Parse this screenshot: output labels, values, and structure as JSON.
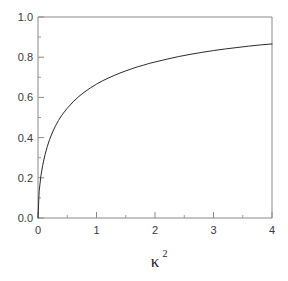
{
  "figure": {
    "background_color": "#ffffff",
    "frame_color": "#8a8a8a",
    "curve_color": "#2b2b2b",
    "tick_label_color": "#3a3a3a",
    "axis_label_color": "#222222"
  },
  "chart_data": {
    "type": "line",
    "title": "",
    "subtitle": "",
    "xlabel": "κ",
    "xlabel_superscript": "2",
    "ylabel": "",
    "xlim": [
      0,
      4
    ],
    "ylim": [
      0.0,
      1.0
    ],
    "grid": false,
    "legend": null,
    "legend_position": "none",
    "xticks": [
      0,
      1,
      2,
      3,
      4
    ],
    "xtick_labels": [
      "0",
      "1",
      "2",
      "3",
      "4"
    ],
    "xminor_step": 0.5,
    "yticks": [
      0.0,
      0.2,
      0.4,
      0.6,
      0.8,
      1.0
    ],
    "ytick_labels": [
      "0.0",
      "0.2",
      "0.4",
      "0.6",
      "0.8",
      "1.0"
    ],
    "yminor_step": 0.1,
    "series": [
      {
        "name": "saturation-curve",
        "color": "#2b2b2b",
        "linewidth": 1,
        "x": [
          0.0,
          0.02,
          0.05,
          0.08,
          0.12,
          0.16,
          0.2,
          0.25,
          0.3,
          0.35,
          0.4,
          0.45,
          0.5,
          0.6,
          0.7,
          0.8,
          0.9,
          1.0,
          1.1,
          1.2,
          1.3,
          1.4,
          1.5,
          1.6,
          1.7,
          1.8,
          1.9,
          2.0,
          2.2,
          2.4,
          2.6,
          2.8,
          3.0,
          3.2,
          3.4,
          3.6,
          3.8,
          4.0
        ],
        "y": [
          0.0,
          0.133,
          0.21,
          0.262,
          0.315,
          0.357,
          0.392,
          0.428,
          0.459,
          0.485,
          0.508,
          0.528,
          0.546,
          0.578,
          0.605,
          0.628,
          0.648,
          0.666,
          0.682,
          0.696,
          0.709,
          0.721,
          0.732,
          0.742,
          0.752,
          0.76,
          0.769,
          0.776,
          0.79,
          0.803,
          0.814,
          0.824,
          0.833,
          0.841,
          0.848,
          0.855,
          0.861,
          0.866
        ]
      }
    ]
  }
}
